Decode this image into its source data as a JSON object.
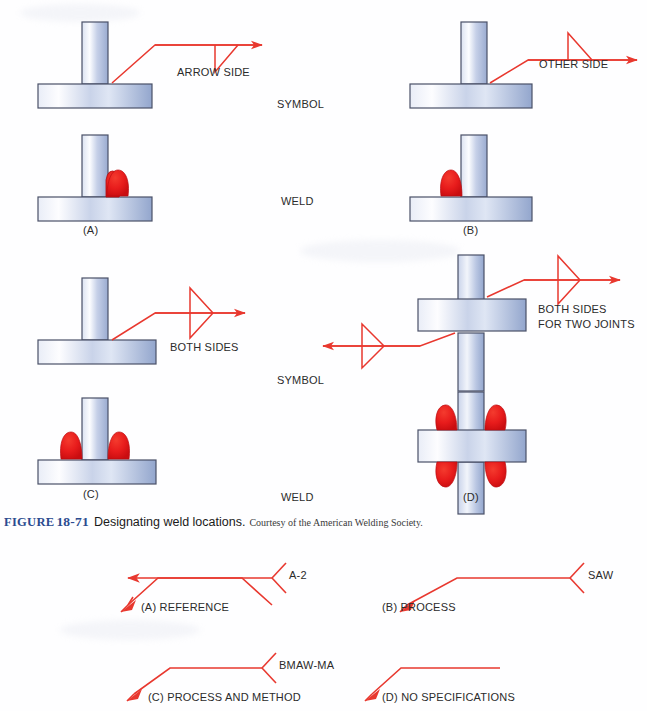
{
  "figure": {
    "label_word": "FIGURE",
    "number": "18-71",
    "title": "Designating weld locations.",
    "credit": "Courtesy of the American Welding Society."
  },
  "colors": {
    "symbol_line": "#e8382f",
    "weld_bead": "#e81c1c",
    "plate_stroke": "#4a5068",
    "plate_light": "#fdfdff",
    "plate_mid": "#c2cce6",
    "plate_dark": "#8fa3cc",
    "text": "#2b2b2b",
    "caption_accent": "#2b4b8f"
  },
  "top_figure": {
    "row_labels": {
      "symbol": "SYMBOL",
      "weld": "WELD"
    },
    "symbol_row": [
      {
        "id": "a",
        "annotation": "ARROW SIDE",
        "symbol_kind": "arrow-side"
      },
      {
        "id": "b",
        "annotation": "OTHER SIDE",
        "symbol_kind": "other-side"
      }
    ],
    "weld_row": [
      {
        "id": "a",
        "caption": "(A)",
        "bead_count": 1
      },
      {
        "id": "b",
        "caption": "(B)",
        "bead_count": 1
      }
    ],
    "symbol_row2": [
      {
        "id": "c",
        "annotation": "BOTH SIDES",
        "symbol_kind": "both-sides"
      },
      {
        "id": "d",
        "annotation_line1": "BOTH SIDES",
        "annotation_line2": "FOR TWO JOINTS",
        "symbol_kind": "both-sides-two-joints"
      }
    ],
    "weld_row2": [
      {
        "id": "c",
        "caption": "(C)",
        "bead_count": 2
      },
      {
        "id": "d",
        "caption": "(D)",
        "bead_count": 4
      }
    ]
  },
  "bottom_figure": {
    "items": [
      {
        "id": "a",
        "tail_text": "A-2",
        "caption": "(A) REFERENCE",
        "has_tail": true
      },
      {
        "id": "b",
        "tail_text": "SAW",
        "caption": "(B) PROCESS",
        "has_tail": true
      },
      {
        "id": "c",
        "tail_text": "BMAW-MA",
        "caption": "(C) PROCESS AND METHOD",
        "has_tail": true
      },
      {
        "id": "d",
        "tail_text": "",
        "caption": "(D) NO SPECIFICATIONS",
        "has_tail": false
      }
    ]
  }
}
